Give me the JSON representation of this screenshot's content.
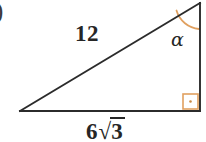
{
  "figure": {
    "type": "right-triangle-diagram",
    "background_color": "#ffffff",
    "stroke_color": "#262626",
    "accent_color": "#e0a060",
    "item_marker": ")",
    "labels": {
      "hypotenuse": "12",
      "base_coefficient": "6",
      "base_radical_symbol": "√",
      "base_radicand": "3",
      "base_full": "6√3",
      "angle": "α"
    },
    "markers": {
      "right_angle": "right-angle-square-with-dot",
      "angle_arc": "alpha-angle-arc"
    },
    "vertices": {
      "left": [
        20,
        111
      ],
      "top_right": [
        200,
        3
      ],
      "bottom_right": [
        200,
        111
      ]
    }
  }
}
